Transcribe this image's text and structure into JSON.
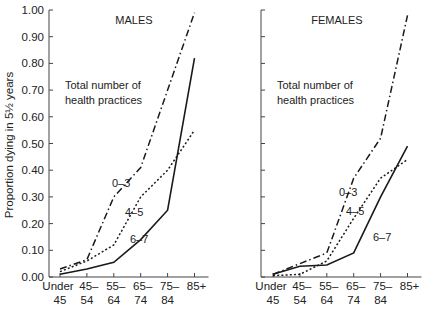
{
  "chart_data": [
    {
      "type": "line",
      "title": "MALES",
      "annotation": [
        "Total number of",
        "health practices"
      ],
      "xlabel": "",
      "ylabel": "Proportion dying in 5½ years",
      "ylim": [
        0,
        1.0
      ],
      "yticks": [
        "0.00",
        "0.10",
        "0.20",
        "0.30",
        "0.40",
        "0.50",
        "0.60",
        "0.70",
        "0.80",
        "0.90",
        "1.00"
      ],
      "categories": [
        [
          "Under",
          "45"
        ],
        [
          "45–",
          "54"
        ],
        [
          "55–",
          "64"
        ],
        [
          "65–",
          "74"
        ],
        [
          "75–",
          "84"
        ],
        [
          "85+",
          ""
        ]
      ],
      "grid": false,
      "series": [
        {
          "name": "0–3",
          "style": "dash-dot",
          "values": [
            0.03,
            0.065,
            0.3,
            0.41,
            0.7,
            0.99
          ]
        },
        {
          "name": "4–5",
          "style": "dotted",
          "values": [
            0.02,
            0.06,
            0.12,
            0.3,
            0.4,
            0.55
          ]
        },
        {
          "name": "6–7",
          "style": "solid",
          "values": [
            0.01,
            0.03,
            0.055,
            0.14,
            0.25,
            0.82
          ]
        }
      ]
    },
    {
      "type": "line",
      "title": "FEMALES",
      "annotation": [
        "Total number of",
        "health practices"
      ],
      "xlabel": "",
      "ylabel": "",
      "ylim": [
        0,
        1.0
      ],
      "categories": [
        [
          "Under",
          "45"
        ],
        [
          "45–",
          "54"
        ],
        [
          "55–",
          "64"
        ],
        [
          "65–",
          "74"
        ],
        [
          "75–",
          "84"
        ],
        [
          "85+",
          ""
        ]
      ],
      "grid": false,
      "series": [
        {
          "name": "0–3",
          "style": "dash-dot",
          "values": [
            0.01,
            0.05,
            0.09,
            0.37,
            0.52,
            0.98
          ]
        },
        {
          "name": "4–5",
          "style": "dotted",
          "values": [
            0.005,
            0.01,
            0.06,
            0.22,
            0.37,
            0.44
          ]
        },
        {
          "name": "6–7",
          "style": "solid",
          "values": [
            0.01,
            0.04,
            0.045,
            0.09,
            0.3,
            0.49
          ]
        }
      ]
    }
  ]
}
